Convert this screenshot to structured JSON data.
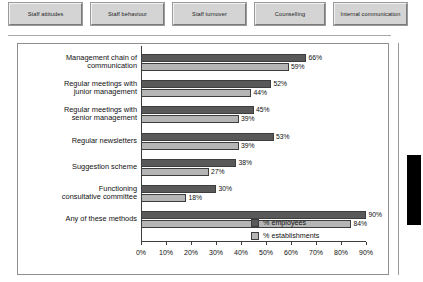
{
  "tabs": [
    {
      "label": "Staff attitudes",
      "width_class": "tab-w1"
    },
    {
      "label": "Staff behaviour",
      "width_class": "tab-w2"
    },
    {
      "label": "Staff turnover",
      "width_class": "tab-w3"
    },
    {
      "label": "Counselling",
      "width_class": "tab-w4"
    },
    {
      "label": "Internal communication",
      "width_class": "tab-w5"
    }
  ],
  "legend": {
    "employees": "% employees",
    "establishments": "% establishments"
  },
  "colors": {
    "employees": "#595959",
    "establishments": "#b5b5b5",
    "frame": "#8e8e8e",
    "axis": "#3d3d3d"
  },
  "chart_data": {
    "type": "bar",
    "orientation": "horizontal",
    "title": "",
    "xlabel": "",
    "ylabel": "",
    "xlim": [
      0,
      90
    ],
    "grid": false,
    "legend_position": "inside-right",
    "xticks": [
      "0%",
      "10%",
      "20%",
      "30%",
      "40%",
      "50%",
      "60%",
      "70%",
      "80%",
      "90%"
    ],
    "xtick_values": [
      0,
      10,
      20,
      30,
      40,
      50,
      60,
      70,
      80,
      90
    ],
    "categories": [
      "Management chain of communication",
      "Regular meetings with junior management",
      "Regular meetings with senior management",
      "Regular newsletters",
      "Suggestion scheme",
      "Functioning consultative committee",
      "Any of these methods"
    ],
    "category_lines": [
      [
        "Management chain of",
        "communication"
      ],
      [
        "Regular meetings with",
        "junior management"
      ],
      [
        "Regular meetings with",
        "senior management"
      ],
      [
        "Regular newsletters"
      ],
      [
        "Suggestion scheme"
      ],
      [
        "Functioning",
        "consultative committee"
      ],
      [
        "Any of these methods"
      ]
    ],
    "series": [
      {
        "name": "% employees",
        "values": [
          66,
          52,
          45,
          53,
          38,
          30,
          90
        ],
        "labels": [
          "66%",
          "52%",
          "45%",
          "53%",
          "38%",
          "30%",
          "90%"
        ]
      },
      {
        "name": "% establishments",
        "values": [
          59,
          44,
          39,
          39,
          27,
          18,
          84
        ],
        "labels": [
          "59%",
          "44%",
          "39%",
          "39%",
          "27%",
          "18%",
          "84%"
        ]
      }
    ]
  }
}
